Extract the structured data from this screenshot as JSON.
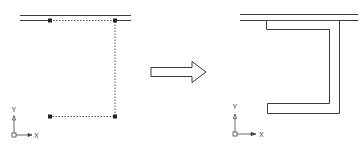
{
  "diagram": {
    "type": "cad-before-after",
    "colors": {
      "line": "#3a3a3a",
      "dotted": "#555555",
      "grip": "#222222",
      "arrow_fill": "#ffffff",
      "background": "#ffffff"
    },
    "before": {
      "wall_double_line": {
        "x1": 20,
        "x2": 131,
        "y_top": 15,
        "y_bottom": 20
      },
      "selected_polyline": {
        "points": [
          [
            50,
            20
          ],
          [
            115,
            20
          ],
          [
            115,
            116
          ],
          [
            50,
            116
          ]
        ],
        "style": "dotted"
      },
      "grips": [
        [
          50,
          20
        ],
        [
          115,
          20
        ],
        [
          115,
          116
        ],
        [
          50,
          116
        ]
      ],
      "ucs_icon": {
        "origin": [
          14,
          135
        ],
        "x_label": "X",
        "y_label": "Y"
      }
    },
    "arrow": {
      "direction": "right",
      "meaning": "transforms-to"
    },
    "after": {
      "wall_double_line": {
        "x1": 240,
        "x2": 358,
        "y_top": 14,
        "y_bottom": 20
      },
      "offset_shape": "U-channel open to left, attached to wall",
      "ucs_icon": {
        "origin": [
          235,
          134
        ],
        "x_label": "X",
        "y_label": "Y"
      }
    }
  }
}
